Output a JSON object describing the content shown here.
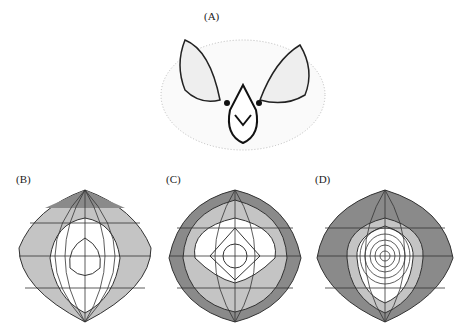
{
  "figure": {
    "panels": [
      {
        "id": "A",
        "label": "(A)",
        "content": "bat face illustration"
      },
      {
        "id": "B",
        "label": "(B)",
        "content": "directional sensitivity contour map"
      },
      {
        "id": "C",
        "label": "(C)",
        "content": "directional sensitivity contour map"
      },
      {
        "id": "D",
        "label": "(D)",
        "content": "directional sensitivity contour map"
      }
    ]
  },
  "colors": {
    "dark_shade": "#8a8a8a",
    "mid_shade": "#c4c4c4",
    "light": "#ffffff",
    "line": "#333333"
  }
}
